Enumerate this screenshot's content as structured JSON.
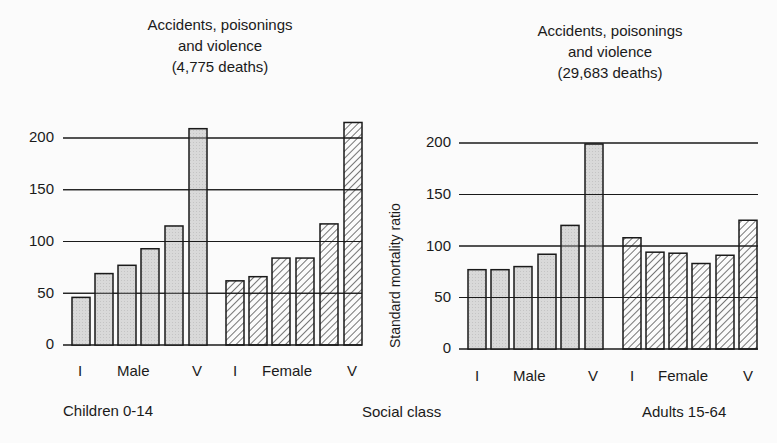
{
  "chart_data": [
    {
      "type": "bar",
      "title": [
        "Accidents, poisonings",
        "and violence",
        "(4,775 deaths)"
      ],
      "group_label": "Children 0-14",
      "xlabel": "Social class",
      "ylabel": "",
      "ylim": [
        0,
        200
      ],
      "yticks": [
        0,
        50,
        100,
        150,
        200
      ],
      "categories": [
        "I",
        "II",
        "IIIN",
        "IIIM",
        "IV",
        "V"
      ],
      "x_tick_labels": {
        "male": [
          "I",
          "Male",
          "V"
        ],
        "female": [
          "I",
          "Female",
          "V"
        ]
      },
      "grid": true,
      "series": [
        {
          "name": "Male",
          "fill": "stippled grey",
          "values": [
            46,
            69,
            77,
            93,
            115,
            209
          ]
        },
        {
          "name": "Female",
          "fill": "hatched",
          "values": [
            62,
            66,
            84,
            84,
            117,
            215
          ]
        }
      ]
    },
    {
      "type": "bar",
      "title": [
        "Accidents, poisonings",
        "and violence",
        "(29,683 deaths)"
      ],
      "group_label": "Adults 15-64",
      "xlabel": "Social class",
      "ylabel": "Standard mortality ratio",
      "ylim": [
        0,
        200
      ],
      "yticks": [
        0,
        50,
        100,
        150,
        200
      ],
      "categories": [
        "I",
        "II",
        "IIIN",
        "IIIM",
        "IV",
        "V"
      ],
      "x_tick_labels": {
        "male": [
          "I",
          "Male",
          "V"
        ],
        "female": [
          "I",
          "Female",
          "V"
        ]
      },
      "grid": true,
      "series": [
        {
          "name": "Male",
          "fill": "stippled grey",
          "values": [
            77,
            77,
            80,
            92,
            120,
            199
          ]
        },
        {
          "name": "Female",
          "fill": "hatched",
          "values": [
            108,
            94,
            93,
            83,
            91,
            125
          ]
        }
      ]
    }
  ],
  "labels": {
    "left_title": [
      "Accidents, poisonings",
      "and violence",
      "(4,775 deaths)"
    ],
    "right_title": [
      "Accidents, poisonings",
      "and violence",
      "(29,683 deaths)"
    ],
    "yticks": [
      "0",
      "50",
      "100",
      "150",
      "200"
    ],
    "x_i": "I",
    "x_v": "V",
    "x_male": "Male",
    "x_female": "Female",
    "children": "Children 0-14",
    "social_class": "Social class",
    "adults": "Adults 15-64",
    "ylabel": "Standard mortality ratio"
  },
  "colors": {
    "bar_fill": "#d6d6d6",
    "ink": "#1a1a1a",
    "background": "#fbfbfb"
  }
}
